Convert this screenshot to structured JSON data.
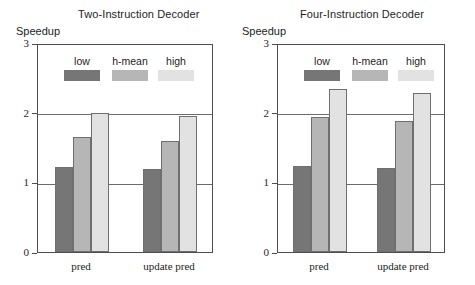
{
  "figure": {
    "background": "#ffffff",
    "axis_color": "#4d4d4d",
    "grid_color": "#6b6b6b"
  },
  "legend": {
    "entries": [
      {
        "label": "low",
        "color": "#767676"
      },
      {
        "label": "h-mean",
        "color": "#b6b6b6"
      },
      {
        "label": "high",
        "color": "#e2e2e2"
      }
    ]
  },
  "panels": [
    {
      "id": "two-instruction-decoder",
      "title": "Two-Instruction Decoder",
      "ylabel": "Speedup"
    },
    {
      "id": "four-instruction-decoder",
      "title": "Four-Instruction Decoder",
      "ylabel": "Speedup"
    }
  ],
  "chart_data": [
    {
      "type": "bar",
      "title": "Two-Instruction Decoder",
      "xlabel": "",
      "ylabel": "Speedup",
      "categories": [
        "pred",
        "update pred"
      ],
      "ylim": [
        0,
        3
      ],
      "yticks": [
        0,
        1,
        2,
        3
      ],
      "ytick_labels": [
        "0",
        "1",
        "2",
        "3"
      ],
      "grid": "horizontal gridlines at y=1 and y=2",
      "legend_position": "inside top-left of plot area",
      "series": [
        {
          "name": "low",
          "color": "#767676",
          "values": [
            1.22,
            1.19
          ]
        },
        {
          "name": "h-mean",
          "color": "#b6b6b6",
          "values": [
            1.65,
            1.6
          ]
        },
        {
          "name": "high",
          "color": "#e2e2e2",
          "values": [
            1.99,
            1.95
          ]
        }
      ]
    },
    {
      "type": "bar",
      "title": "Four-Instruction Decoder",
      "xlabel": "",
      "ylabel": "Speedup",
      "categories": [
        "pred",
        "update pred"
      ],
      "ylim": [
        0,
        3
      ],
      "yticks": [
        0,
        1,
        2,
        3
      ],
      "ytick_labels": [
        "0",
        "1",
        "2",
        "3"
      ],
      "grid": "horizontal gridlines at y=1 and y=2",
      "legend_position": "inside top-left of plot area",
      "series": [
        {
          "name": "low",
          "color": "#767676",
          "values": [
            1.24,
            1.2
          ]
        },
        {
          "name": "h-mean",
          "color": "#b6b6b6",
          "values": [
            1.94,
            1.88
          ]
        },
        {
          "name": "high",
          "color": "#e2e2e2",
          "values": [
            2.34,
            2.28
          ]
        }
      ]
    }
  ]
}
